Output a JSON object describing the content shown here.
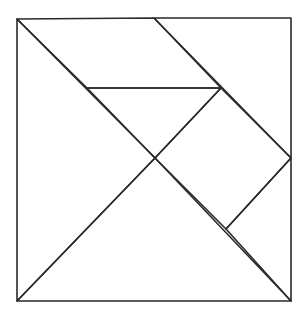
{
  "diagram": {
    "type": "tangram-square",
    "background": "#ffffff",
    "stroke_color": "#2a2a2a",
    "points": {
      "TL": [
        17,
        19
      ],
      "TR": [
        291,
        18
      ],
      "BR": [
        291,
        301
      ],
      "BL": [
        17,
        301
      ],
      "TM": [
        154,
        18
      ],
      "C": [
        155,
        158
      ],
      "MR": [
        291,
        158
      ],
      "P": [
        221,
        88
      ],
      "Q": [
        87,
        88
      ],
      "R": [
        226,
        229
      ]
    },
    "pieces": [
      {
        "name": "large-triangle-left",
        "points": [
          [
            17,
            19
          ],
          [
            155,
            158
          ],
          [
            17,
            301
          ]
        ]
      },
      {
        "name": "large-triangle-bottom",
        "points": [
          [
            17,
            301
          ],
          [
            155,
            158
          ],
          [
            291,
            301
          ]
        ]
      },
      {
        "name": "medium-triangle-right",
        "points": [
          [
            154,
            18
          ],
          [
            291,
            18
          ],
          [
            291,
            158
          ]
        ]
      },
      {
        "name": "parallelogram-top",
        "points": [
          [
            17,
            19
          ],
          [
            154,
            18
          ],
          [
            221,
            88
          ],
          [
            87,
            88
          ]
        ]
      },
      {
        "name": "small-triangle-top",
        "points": [
          [
            87,
            88
          ],
          [
            221,
            88
          ],
          [
            155,
            158
          ]
        ]
      },
      {
        "name": "square-right",
        "points": [
          [
            221,
            88
          ],
          [
            291,
            158
          ],
          [
            226,
            229
          ],
          [
            155,
            158
          ]
        ]
      },
      {
        "name": "small-triangle-bottom-right",
        "points": [
          [
            226,
            229
          ],
          [
            291,
            158
          ],
          [
            291,
            301
          ]
        ]
      }
    ]
  }
}
